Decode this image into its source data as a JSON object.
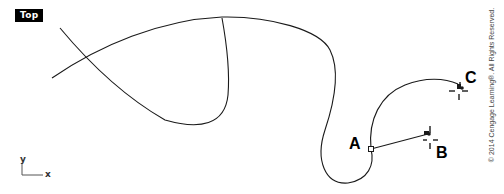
{
  "viewport": {
    "label": "Top",
    "background": "#ffffff",
    "curve_color": "#1a1a1a"
  },
  "points": {
    "a": {
      "label": "A",
      "x": 371,
      "y": 149
    },
    "b": {
      "label": "B",
      "x": 429,
      "y": 134
    },
    "c": {
      "label": "C",
      "x": 461,
      "y": 89
    }
  },
  "axes": {
    "x_label": "x",
    "y_label": "y"
  },
  "copyright": "© 2014 Cengage Learning®. All Rights Reserved."
}
